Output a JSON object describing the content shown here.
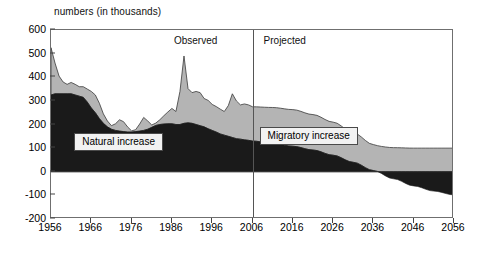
{
  "chart_data": {
    "type": "area",
    "title": "",
    "ylabel": "numbers (in thousands)",
    "xlabel": "",
    "ylim": [
      -200,
      600
    ],
    "xlim": [
      1956,
      2056
    ],
    "yticks": [
      600,
      500,
      400,
      300,
      200,
      100,
      0,
      -100,
      -200
    ],
    "ytick_labels": [
      "600",
      "500",
      "400",
      "300",
      "200",
      "100",
      "0",
      "-100",
      "-200"
    ],
    "xticks": [
      1956,
      1966,
      1976,
      1986,
      1996,
      2006,
      2016,
      2026,
      2036,
      2046,
      2056
    ],
    "xtick_labels": [
      "1956",
      "1966",
      "1976",
      "1986",
      "1996",
      "2006",
      "2016",
      "2026",
      "2036",
      "2046",
      "2056"
    ],
    "grid": false,
    "legend_position": "inside",
    "stacked": true,
    "annotations": [
      {
        "name": "observed-label",
        "text": "Observed",
        "x": 1999,
        "y": 555
      },
      {
        "name": "projected-label",
        "text": "Projected",
        "x": 2009,
        "y": 555
      },
      {
        "name": "divider-line",
        "text": "",
        "x": 2006,
        "y": 0
      }
    ],
    "series": [
      {
        "name": "Natural increase",
        "color": "#1a1a1a",
        "x": [
          1956,
          1957,
          1958,
          1959,
          1960,
          1961,
          1962,
          1963,
          1964,
          1965,
          1966,
          1967,
          1968,
          1969,
          1970,
          1971,
          1972,
          1973,
          1974,
          1975,
          1976,
          1977,
          1978,
          1979,
          1980,
          1981,
          1982,
          1983,
          1984,
          1985,
          1986,
          1987,
          1988,
          1989,
          1990,
          1991,
          1992,
          1993,
          1994,
          1995,
          1996,
          1997,
          1998,
          1999,
          2000,
          2001,
          2002,
          2003,
          2004,
          2005,
          2006,
          2011,
          2016,
          2021,
          2026,
          2031,
          2036,
          2041,
          2046,
          2051,
          2056
        ],
        "values": [
          325,
          330,
          330,
          330,
          330,
          330,
          325,
          320,
          315,
          295,
          270,
          250,
          225,
          205,
          190,
          180,
          175,
          172,
          170,
          168,
          168,
          170,
          172,
          175,
          180,
          188,
          196,
          200,
          202,
          203,
          203,
          200,
          200,
          205,
          207,
          205,
          200,
          195,
          190,
          182,
          175,
          168,
          160,
          155,
          150,
          145,
          140,
          138,
          135,
          133,
          130,
          120,
          108,
          92,
          70,
          40,
          5,
          -30,
          -60,
          -82,
          -98
        ]
      },
      {
        "name": "Migratory increase",
        "color": "#b4b4b4",
        "x": [
          1956,
          1957,
          1958,
          1959,
          1960,
          1961,
          1962,
          1963,
          1964,
          1965,
          1966,
          1967,
          1968,
          1969,
          1970,
          1971,
          1972,
          1973,
          1974,
          1975,
          1976,
          1977,
          1978,
          1979,
          1980,
          1981,
          1982,
          1983,
          1984,
          1985,
          1986,
          1987,
          1988,
          1989,
          1990,
          1991,
          1992,
          1993,
          1994,
          1995,
          1996,
          1997,
          1998,
          1999,
          2000,
          2001,
          2002,
          2003,
          2004,
          2005,
          2006,
          2011,
          2016,
          2021,
          2026,
          2031,
          2036,
          2041,
          2046,
          2051,
          2056
        ],
        "values": [
          200,
          130,
          75,
          50,
          40,
          48,
          45,
          40,
          45,
          55,
          70,
          75,
          65,
          40,
          25,
          15,
          28,
          48,
          42,
          22,
          5,
          8,
          30,
          55,
          35,
          10,
          10,
          20,
          35,
          50,
          65,
          55,
          140,
          285,
          145,
          130,
          140,
          140,
          120,
          120,
          110,
          108,
          105,
          100,
          130,
          185,
          160,
          145,
          152,
          150,
          145,
          152,
          155,
          150,
          140,
          125,
          110,
          102,
          100,
          100,
          100
        ]
      }
    ],
    "totals_note": "Stacked: Migratory increase plotted on top of Natural increase"
  },
  "labels": {
    "natural_increase": "Natural increase",
    "migratory_increase": "Migratory increase",
    "observed": "Observed",
    "projected": "Projected",
    "axis_title": "numbers (in thousands)"
  },
  "colors": {
    "natural": "#1a1a1a",
    "migratory": "#b4b4b4",
    "frame": "#6f6f6f",
    "divider": "#555555",
    "background": "#ffffff"
  }
}
